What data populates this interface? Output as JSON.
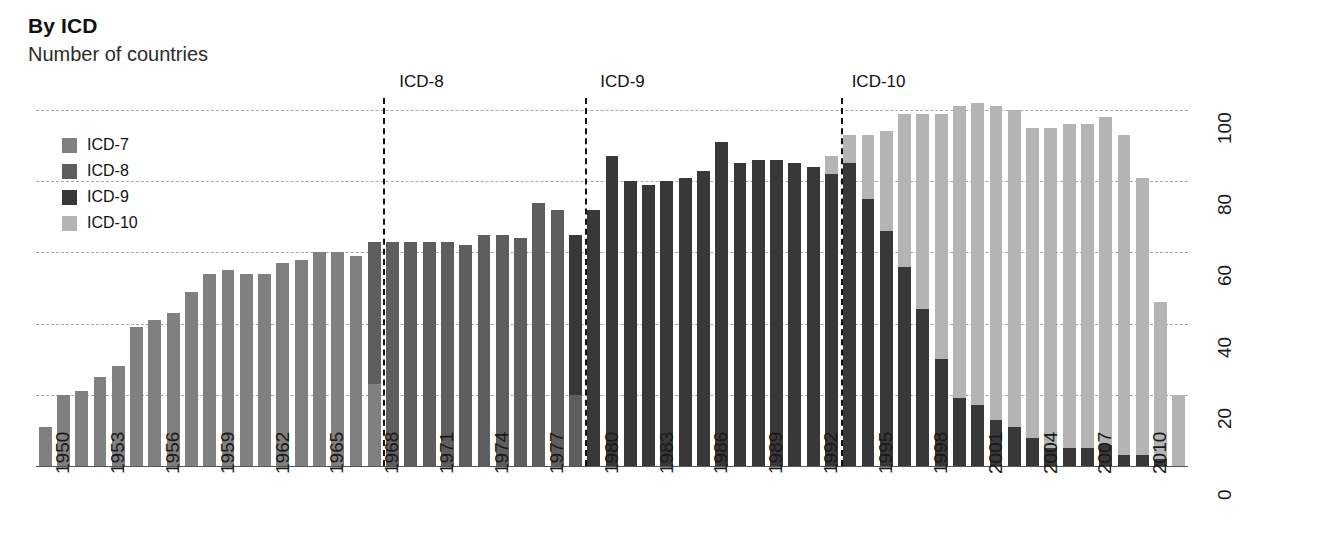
{
  "header": {
    "title": "By ICD",
    "subtitle": "Number of countries"
  },
  "legend": {
    "position": "top-left",
    "items": [
      {
        "label": "ICD-7",
        "color": "#808080"
      },
      {
        "label": "ICD-8",
        "color": "#5e5e5e"
      },
      {
        "label": "ICD-9",
        "color": "#383838"
      },
      {
        "label": "ICD-10",
        "color": "#b4b4b4"
      }
    ]
  },
  "annotations": [
    {
      "label": "ICD-8",
      "year": 1968.5
    },
    {
      "label": "ICD-9",
      "year": 1979.5
    },
    {
      "label": "ICD-10",
      "year": 1993.5
    }
  ],
  "chart_data": {
    "type": "bar",
    "stacked": true,
    "title": "By ICD",
    "subtitle": "Number of countries",
    "xlabel": "",
    "ylabel": "Number of countries",
    "ylim": [
      0,
      100
    ],
    "yticks": [
      0,
      20,
      40,
      60,
      80,
      100
    ],
    "grid": true,
    "x_tick_step": 3,
    "categories": [
      1950,
      1951,
      1952,
      1953,
      1954,
      1955,
      1956,
      1957,
      1958,
      1959,
      1960,
      1961,
      1962,
      1963,
      1964,
      1965,
      1966,
      1967,
      1968,
      1969,
      1970,
      1971,
      1972,
      1973,
      1974,
      1975,
      1976,
      1977,
      1978,
      1979,
      1980,
      1981,
      1982,
      1983,
      1984,
      1985,
      1986,
      1987,
      1988,
      1989,
      1990,
      1991,
      1992,
      1993,
      1994,
      1995,
      1996,
      1997,
      1998,
      1999,
      2000,
      2001,
      2002,
      2003,
      2004,
      2005,
      2006,
      2007,
      2008,
      2009,
      2010,
      2011,
      2012
    ],
    "series": [
      {
        "name": "ICD-7",
        "color": "#808080",
        "values": [
          11,
          20,
          21,
          25,
          28,
          39,
          41,
          43,
          49,
          54,
          55,
          54,
          54,
          57,
          58,
          60,
          60,
          59,
          23,
          0,
          0,
          0,
          0,
          0,
          0,
          0,
          0,
          0,
          0,
          0,
          0,
          0,
          0,
          0,
          0,
          0,
          0,
          0,
          0,
          0,
          0,
          0,
          0,
          0,
          0,
          0,
          0,
          0,
          0,
          0,
          0,
          0,
          0,
          0,
          0,
          0,
          0,
          0,
          0,
          0,
          0,
          0,
          0
        ]
      },
      {
        "name": "ICD-8",
        "color": "#5e5e5e",
        "values": [
          0,
          0,
          0,
          0,
          0,
          0,
          0,
          0,
          0,
          0,
          0,
          0,
          0,
          0,
          0,
          0,
          0,
          0,
          40,
          63,
          63,
          63,
          63,
          62,
          65,
          65,
          64,
          74,
          72,
          20,
          0,
          0,
          0,
          0,
          0,
          0,
          0,
          0,
          0,
          0,
          0,
          0,
          0,
          0,
          0,
          0,
          0,
          0,
          0,
          0,
          0,
          0,
          0,
          0,
          0,
          0,
          0,
          0,
          0,
          0,
          0,
          0,
          0
        ]
      },
      {
        "name": "ICD-9",
        "color": "#383838",
        "values": [
          0,
          0,
          0,
          0,
          0,
          0,
          0,
          0,
          0,
          0,
          0,
          0,
          0,
          0,
          0,
          0,
          0,
          0,
          0,
          0,
          0,
          0,
          0,
          0,
          0,
          0,
          0,
          0,
          0,
          45,
          72,
          87,
          80,
          79,
          80,
          81,
          83,
          91,
          85,
          86,
          86,
          85,
          84,
          82,
          85,
          75,
          66,
          56,
          44,
          30,
          19,
          17,
          13,
          11,
          8,
          5,
          5,
          5,
          6,
          3,
          3,
          2,
          0
        ]
      },
      {
        "name": "ICD-10",
        "color": "#b4b4b4",
        "values": [
          0,
          0,
          0,
          0,
          0,
          0,
          0,
          0,
          0,
          0,
          0,
          0,
          0,
          0,
          0,
          0,
          0,
          0,
          0,
          0,
          0,
          0,
          0,
          0,
          0,
          0,
          0,
          0,
          0,
          0,
          0,
          0,
          0,
          0,
          0,
          0,
          0,
          0,
          0,
          0,
          0,
          0,
          0,
          5,
          8,
          18,
          28,
          43,
          55,
          69,
          82,
          85,
          88,
          89,
          87,
          90,
          91,
          91,
          92,
          90,
          78,
          44,
          20
        ]
      }
    ],
    "totals": [
      11,
      20,
      21,
      25,
      28,
      39,
      41,
      43,
      49,
      54,
      55,
      54,
      54,
      57,
      58,
      60,
      60,
      59,
      63,
      63,
      63,
      63,
      63,
      62,
      65,
      65,
      64,
      74,
      72,
      65,
      72,
      87,
      80,
      79,
      80,
      81,
      83,
      91,
      85,
      86,
      86,
      85,
      84,
      87,
      93,
      93,
      94,
      99,
      99,
      99,
      101,
      102,
      101,
      100,
      95,
      95,
      96,
      96,
      98,
      93,
      81,
      46,
      20
    ]
  }
}
